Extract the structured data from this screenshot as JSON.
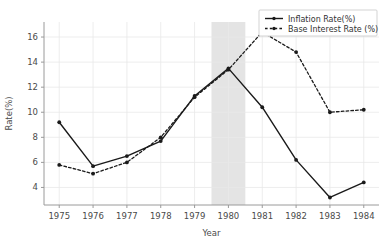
{
  "chart_data": {
    "type": "line",
    "title": "",
    "xlabel": "Year",
    "ylabel": "Rate(%)",
    "x": [
      1975,
      1976,
      1977,
      1978,
      1979,
      1980,
      1981,
      1982,
      1983,
      1984
    ],
    "xticklabels": [
      "1975",
      "1976",
      "1977",
      "1978",
      "1979",
      "1980",
      "1981",
      "1982",
      "1983",
      "1984"
    ],
    "yticklabels": [
      "4",
      "6",
      "8",
      "10",
      "12",
      "14",
      "16"
    ],
    "yticks": [
      4,
      6,
      8,
      10,
      12,
      14,
      16
    ],
    "xlim": [
      1974.55,
      1984.45
    ],
    "ylim": [
      2.6,
      17.2
    ],
    "grid": true,
    "legend_position": "top-right",
    "series": [
      {
        "name": "Inflation Rate(%)",
        "style": "solid",
        "marker": "circle",
        "color": "#1a1a1a",
        "values": [
          9.2,
          5.7,
          6.5,
          7.7,
          11.3,
          13.5,
          10.4,
          6.2,
          3.2,
          4.4
        ]
      },
      {
        "name": "Base Interest Rate (%)",
        "style": "dashed",
        "marker": "circle",
        "color": "#1a1a1a",
        "values": [
          5.8,
          5.1,
          6.0,
          8.0,
          11.2,
          13.4,
          16.4,
          14.8,
          10.0,
          10.2
        ]
      }
    ],
    "annotations": [
      {
        "type": "vspan",
        "name": "highlight-band-1980",
        "x_start": 1979.5,
        "x_end": 1980.5,
        "color": "#e4e4e4"
      }
    ]
  },
  "legend": {
    "items": [
      {
        "label": "Inflation Rate(%)",
        "style": "solid"
      },
      {
        "label": "Base Interest Rate (%)",
        "style": "dashed"
      }
    ]
  },
  "axes": {
    "x_title": "Year",
    "y_title": "Rate(%)"
  },
  "colors": {
    "line": "#1a1a1a",
    "grid": "#e8e8e8",
    "spine": "#9a9a9a",
    "band": "#e4e4e4",
    "legend_border": "#c8c8c8",
    "text": "#4a4a4a"
  }
}
